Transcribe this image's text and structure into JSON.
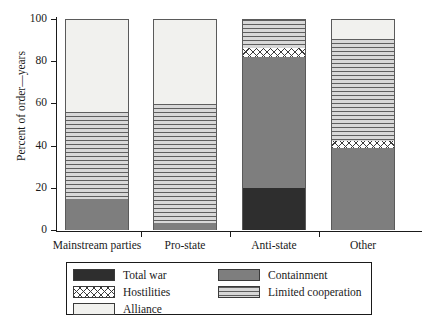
{
  "chart_data": {
    "type": "bar",
    "subtype": "stacked-bar-100",
    "title": "",
    "xlabel": "",
    "ylabel": "Percent of order—years",
    "ylim": [
      0,
      100
    ],
    "yticks": [
      0,
      20,
      40,
      60,
      80,
      100
    ],
    "ytick_labels": [
      "0",
      "20",
      "40",
      "60",
      "80",
      "100"
    ],
    "grid": false,
    "legend_position": "bottom",
    "categories": [
      "Mainstream parties",
      "Pro-state",
      "Anti-state",
      "Other"
    ],
    "series": [
      {
        "name": "Total war",
        "values": [
          0,
          0,
          20,
          0
        ]
      },
      {
        "name": "Containment",
        "values": [
          15,
          3.5,
          62.5,
          39
        ]
      },
      {
        "name": "Hostilities",
        "values": [
          0,
          0,
          4,
          3.5
        ]
      },
      {
        "name": "Limited cooperation",
        "values": [
          41,
          56.5,
          13.5,
          48.5
        ]
      },
      {
        "name": "Alliance",
        "values": [
          44,
          40,
          0,
          9
        ]
      }
    ]
  },
  "axis": {
    "y_label": "Percent of order—years",
    "y_ticks": [
      "100",
      "80",
      "60",
      "40",
      "20",
      "0"
    ]
  },
  "bars": [
    {
      "category": "Mainstream parties",
      "segments": [
        {
          "series": "Containment",
          "value": 15,
          "pattern": "containment"
        },
        {
          "series": "Limited cooperation",
          "value": 41,
          "pattern": "limited"
        },
        {
          "series": "Alliance",
          "value": 44,
          "pattern": "alliance"
        }
      ]
    },
    {
      "category": "Pro-state",
      "segments": [
        {
          "series": "Containment",
          "value": 3.5,
          "pattern": "containment"
        },
        {
          "series": "Limited cooperation",
          "value": 56.5,
          "pattern": "limited"
        },
        {
          "series": "Alliance",
          "value": 40,
          "pattern": "alliance"
        }
      ]
    },
    {
      "category": "Anti-state",
      "segments": [
        {
          "series": "Total war",
          "value": 20,
          "pattern": "total-war"
        },
        {
          "series": "Containment",
          "value": 62.5,
          "pattern": "containment"
        },
        {
          "series": "Hostilities",
          "value": 4,
          "pattern": "hostilities"
        },
        {
          "series": "Limited cooperation",
          "value": 13.5,
          "pattern": "limited"
        }
      ]
    },
    {
      "category": "Other",
      "segments": [
        {
          "series": "Containment",
          "value": 39,
          "pattern": "containment"
        },
        {
          "series": "Hostilities",
          "value": 3.5,
          "pattern": "hostilities"
        },
        {
          "series": "Limited cooperation",
          "value": 48.5,
          "pattern": "limited"
        },
        {
          "series": "Alliance",
          "value": 9,
          "pattern": "alliance"
        }
      ]
    }
  ],
  "legend": {
    "rows": [
      {
        "left": {
          "label": "Total war",
          "pattern": "total-war"
        },
        "right": {
          "label": "Containment",
          "pattern": "containment"
        }
      },
      {
        "left": {
          "label": "Hostilities",
          "pattern": "hostilities"
        },
        "right": {
          "label": "Limited cooperation",
          "pattern": "limited"
        }
      },
      {
        "left": {
          "label": "Alliance",
          "pattern": "alliance"
        },
        "right": null
      }
    ]
  },
  "colors": {
    "total_war": "#2e2e2e",
    "containment": "#7e7e7e",
    "hostilities": "#ffffff",
    "limited_cooperation": "#d8d8d8",
    "alliance": "#f1f1ee",
    "axis": "#1a1a1a"
  }
}
